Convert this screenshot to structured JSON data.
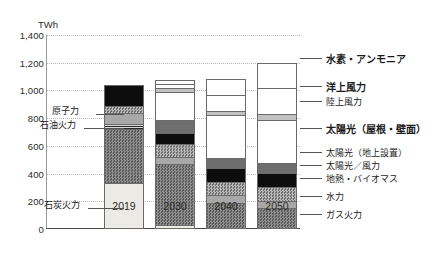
{
  "chart": {
    "type": "bar",
    "unit_label": "TWh",
    "title": "",
    "xlabel": "",
    "ylabel": "TWh"
  },
  "axis": {
    "y_ticks": [
      "0",
      "200",
      "400",
      "600",
      "800",
      "1,000",
      "1,200",
      "1,400"
    ],
    "y_values": [
      0,
      200,
      400,
      600,
      800,
      1000,
      1200,
      1400
    ],
    "y_min": 0,
    "y_max": 1400,
    "grid": true,
    "x_ticks": [
      "2019",
      "2030",
      "2040",
      "2050"
    ]
  },
  "legend": {
    "position": "right",
    "items": [
      {
        "label": "水素・アンモニア",
        "key": "hydrogen-ammonia",
        "bold": true
      },
      {
        "label": "洋上風力",
        "key": "offshore-wind",
        "bold": true
      },
      {
        "label": "陸上風力",
        "key": "onshore-wind",
        "bold": false
      },
      {
        "label": "太陽光（屋根・壁面）",
        "key": "solar-roof-wall",
        "bold": true
      },
      {
        "label": "太陽光（地上設置）",
        "key": "solar-ground",
        "bold": false
      },
      {
        "label": "太陽光／風力",
        "key": "solar-wind",
        "bold": false
      },
      {
        "label": "地熱・バイオマス",
        "key": "geothermal-biomass",
        "bold": false
      },
      {
        "label": "水力",
        "key": "hydro",
        "bold": false
      },
      {
        "label": "ガス火力",
        "key": "gas-thermal",
        "bold": false
      }
    ]
  },
  "callouts": [
    {
      "label": "原子力",
      "key": "nuclear"
    },
    {
      "label": "石油火力",
      "key": "oil-thermal"
    },
    {
      "label": "石炭火力",
      "key": "coal-thermal"
    }
  ],
  "chart_data": {
    "type": "bar",
    "stacked": true,
    "title": "",
    "xlabel": "",
    "ylabel": "TWh",
    "ylim": [
      0,
      1400
    ],
    "grid": true,
    "legend_position": "right",
    "categories": [
      "2019",
      "2030",
      "2040",
      "2050"
    ],
    "series": [
      {
        "name": "石炭火力",
        "key": "coal-thermal",
        "values": [
          330,
          30,
          0,
          0
        ]
      },
      {
        "name": "ガス火力",
        "key": "gas-thermal",
        "values": [
          390,
          440,
          190,
          150
        ]
      },
      {
        "name": "石油火力",
        "key": "oil-thermal",
        "values": [
          35,
          0,
          0,
          0
        ]
      },
      {
        "name": "水力",
        "key": "hydro",
        "values": [
          80,
          50,
          55,
          55
        ]
      },
      {
        "name": "地熱・バイオマス",
        "key": "geothermal-biomass",
        "values": [
          55,
          90,
          95,
          95
        ]
      },
      {
        "name": "太陽光／風力",
        "key": "solar-wind",
        "values": [
          150,
          85,
          100,
          105
        ]
      },
      {
        "name": "太陽光（地上設置）",
        "key": "solar-ground",
        "values": [
          0,
          95,
          70,
          70
        ]
      },
      {
        "name": "太陽光（屋根・壁面）",
        "key": "solar-roof-wall",
        "values": [
          0,
          200,
          310,
          310
        ]
      },
      {
        "name": "陸上風力",
        "key": "onshore-wind",
        "values": [
          0,
          25,
          30,
          45
        ]
      },
      {
        "name": "洋上風力",
        "key": "offshore-wind",
        "values": [
          0,
          30,
          115,
          185
        ]
      },
      {
        "name": "水素・アンモニア",
        "key": "hydrogen-ammonia",
        "values": [
          0,
          30,
          120,
          185
        ]
      }
    ],
    "totals": [
      1040,
      1075,
      1085,
      1200
    ]
  }
}
